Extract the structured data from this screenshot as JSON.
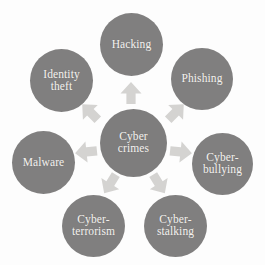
{
  "diagram": {
    "type": "radial-hub-and-spoke",
    "title": "Cyber crimes",
    "background_color": "#fdfdfd",
    "node_color": "#807f7f",
    "node_text_color": "#f4f2ef",
    "arrow_color": "#d4d3d1",
    "center": {
      "id": "cyber-crimes",
      "label": "Cyber\ncrimes",
      "line1": "Cyber",
      "line2": "crimes"
    },
    "spokes": [
      {
        "id": "hacking",
        "label": "Hacking",
        "line1": "Hacking",
        "line2": "",
        "position": "top",
        "angle_deg": 90
      },
      {
        "id": "phishing",
        "label": "Phishing",
        "line1": "Phishing",
        "line2": "",
        "position": "top-right",
        "angle_deg": 40
      },
      {
        "id": "cyber-bullying",
        "label": "Cyber-bullying",
        "line1": "Cyber-",
        "line2": "bullying",
        "position": "right",
        "angle_deg": -12
      },
      {
        "id": "cyber-stalking",
        "label": "Cyber-stalking",
        "line1": "Cyber-",
        "line2": "stalking",
        "position": "bottom-right",
        "angle_deg": -62
      },
      {
        "id": "cyber-terrorism",
        "label": "Cyber-terrorism",
        "line1": "Cyber-",
        "line2": "terrorism",
        "position": "bottom-left",
        "angle_deg": -118
      },
      {
        "id": "malware",
        "label": "Malware",
        "line1": "Malware",
        "line2": "",
        "position": "left",
        "angle_deg": 192
      },
      {
        "id": "identity-theft",
        "label": "Identity theft",
        "line1": "Identity",
        "line2": "theft",
        "position": "top-left",
        "angle_deg": 140
      }
    ],
    "arrows": [
      {
        "id": "arrow-to-hacking",
        "target": "hacking",
        "direction": "up"
      },
      {
        "id": "arrow-to-phishing",
        "target": "phishing",
        "direction": "up-right"
      },
      {
        "id": "arrow-to-cyber-bullying",
        "target": "cyber-bullying",
        "direction": "right"
      },
      {
        "id": "arrow-to-cyber-stalking",
        "target": "cyber-stalking",
        "direction": "down-right"
      },
      {
        "id": "arrow-to-cyber-terrorism",
        "target": "cyber-terrorism",
        "direction": "down-left"
      },
      {
        "id": "arrow-to-malware",
        "target": "malware",
        "direction": "left"
      },
      {
        "id": "arrow-to-identity-theft",
        "target": "identity-theft",
        "direction": "up-left"
      }
    ]
  }
}
